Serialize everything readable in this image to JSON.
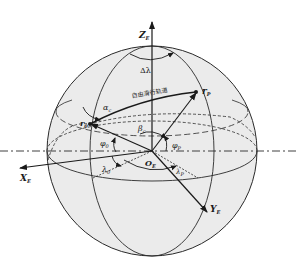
{
  "diagram": {
    "type": "earth-centered coordinate sphere",
    "colors": {
      "sphere_fill": "#ebebeb",
      "line": "#2a2a2a",
      "text": "#1a1a1a"
    },
    "axes": {
      "z": {
        "main": "Z",
        "sub": "E"
      },
      "x": {
        "main": "X",
        "sub": "E"
      },
      "y": {
        "main": "Y",
        "sub": "E"
      },
      "origin": {
        "main": "O",
        "sub": "E"
      }
    },
    "points": {
      "start": {
        "main": "r",
        "sub": "0"
      },
      "end": {
        "main": "r",
        "sub": "P"
      }
    },
    "angles": {
      "delta_lambda": "Δλ",
      "alpha": {
        "main": "α",
        "sub": "c"
      },
      "beta": {
        "main": "β",
        "sub": "c"
      },
      "phi0": {
        "main": "φ",
        "sub": "0"
      },
      "phiP": {
        "main": "φ",
        "sub": "P"
      },
      "lambda0": {
        "main": "λ",
        "sub": "0"
      },
      "lambdaP": {
        "main": "λ",
        "sub": "P"
      }
    },
    "trajectory_label": "自由滑行轨道"
  }
}
